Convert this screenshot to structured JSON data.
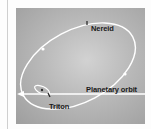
{
  "diagram": {
    "labels": {
      "nereid": "Nereid",
      "planetary_orbit": "Planetary orbit",
      "triton": "Triton"
    },
    "elements": [
      {
        "id": "nereid-orbit",
        "shape": "ellipse",
        "description": "Large eccentric, inclined orbit of Nereid"
      },
      {
        "id": "triton-orbit",
        "shape": "ellipse",
        "description": "Small retrograde orbit of Triton around planet"
      },
      {
        "id": "planetary-orbit",
        "shape": "line-arrow",
        "description": "Planetary orbit direction, arrow pointing left"
      },
      {
        "id": "nereid-marker",
        "shape": "tick",
        "description": "Position marker of Nereid on its orbit"
      },
      {
        "id": "triton-marker",
        "shape": "tick",
        "description": "Position marker of Triton on its orbit"
      }
    ],
    "colors": {
      "panel_light": "#d2d2d2",
      "panel_dark": "#9e9e9e",
      "orbit_line": "#ffffff",
      "text": "#1a1a1a"
    }
  }
}
